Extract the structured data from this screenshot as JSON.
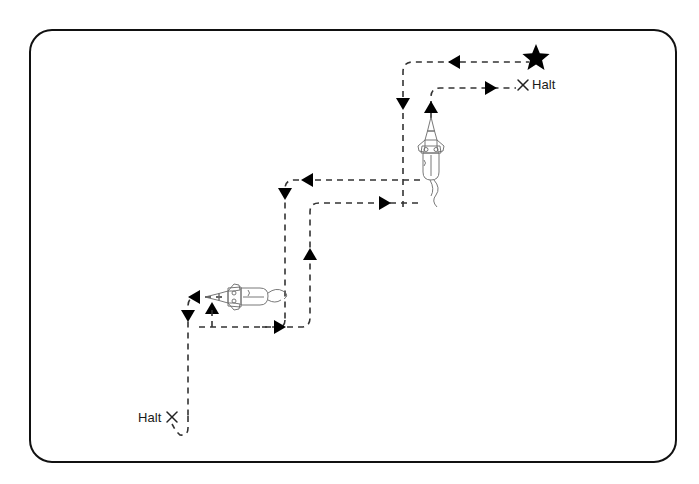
{
  "figure": {
    "background_color": "#ffffff",
    "border": {
      "name": "rounded-frame",
      "x": 30,
      "y": 30,
      "width": 646,
      "height": 432,
      "radius": 22,
      "stroke_color": "#111111",
      "stroke_width": 2
    },
    "path": {
      "stroke_color": "#333333",
      "stroke_width": 1.6,
      "dash_pattern": "6 5",
      "style": "dashed"
    },
    "markers": {
      "arrow_color": "#000000",
      "star_color": "#000000",
      "cross_color": "#222222"
    }
  },
  "labels": {
    "halt_top": "Halt",
    "halt_bottom": "Halt"
  },
  "goal": {
    "name": "goal-star",
    "symbol": "star",
    "x": 536,
    "y": 56,
    "size": 11
  },
  "halt_markers": [
    {
      "name": "halt-cross-top",
      "symbol": "x",
      "x": 523,
      "y": 85
    },
    {
      "name": "halt-cross-bottom",
      "symbol": "x",
      "x": 172,
      "y": 417
    }
  ],
  "robots": [
    {
      "name": "rocket-upper",
      "orientation": "up",
      "x": 431,
      "y": 150,
      "scale": 1.0
    },
    {
      "name": "rocket-lower",
      "orientation": "left",
      "x": 236,
      "y": 297,
      "scale": 1.0
    }
  ],
  "path_segments": {
    "upper_route_outbound": "M 403 205 L 403 70 Q 403 62 411 62 L 529 62",
    "upper_route_inbound": "M 431 120 L 431 96 Q 431 88 439 88 L 517 88",
    "mid_route_left": "M 418 178 Q 411 178 411 186 L 411 180 L 293 180 Q 285 180 285 188 L 285 318",
    "mid_route_right": "M 420 203 L 318 203 Q 310 203 310 211 L 310 318 Q 310 326 302 326 L 197 326",
    "lower_route_in": "M 285 318 Q 285 326 277 326 L 252 326",
    "lower_route_up": "M 228 297 L 196 297 Q 188 297 188 305 L 188 418 Q 188 432 199 432 L 196 432",
    "lower_loop": "M 188 418 L 188 430 Q 190 436 180 434 L 172 425"
  },
  "arrows": [
    {
      "name": "arrow-left-top",
      "x": 457,
      "y": 62,
      "direction": "left"
    },
    {
      "name": "arrow-down-upper",
      "x": 403,
      "y": 103,
      "direction": "down"
    },
    {
      "name": "arrow-right-halt-top",
      "x": 487,
      "y": 88,
      "direction": "right"
    },
    {
      "name": "arrow-up-rocket-upper",
      "x": 431,
      "y": 109,
      "direction": "up"
    },
    {
      "name": "arrow-left-mid",
      "x": 310,
      "y": 180,
      "direction": "left"
    },
    {
      "name": "arrow-right-mid",
      "x": 381,
      "y": 203,
      "direction": "right"
    },
    {
      "name": "arrow-down-mid",
      "x": 285,
      "y": 193,
      "direction": "down"
    },
    {
      "name": "arrow-up-mid",
      "x": 310,
      "y": 256,
      "direction": "up"
    },
    {
      "name": "arrow-right-lower",
      "x": 276,
      "y": 326,
      "direction": "right"
    },
    {
      "name": "arrow-left-lower",
      "x": 196,
      "y": 297,
      "direction": "left"
    },
    {
      "name": "arrow-down-lower",
      "x": 188,
      "y": 314,
      "direction": "down"
    },
    {
      "name": "arrow-up-lower",
      "x": 212,
      "y": 310,
      "direction": "up"
    }
  ]
}
